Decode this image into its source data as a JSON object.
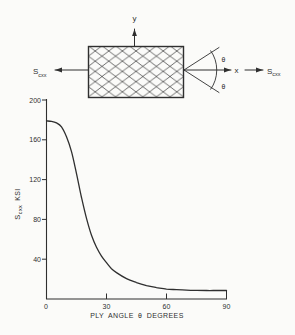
{
  "figure": {
    "ink": "#2f2f2f",
    "background": "#fbfbf9"
  },
  "diagram": {
    "y_arrow_label": "y",
    "x_arrow_label": "x",
    "theta_upper": "θ",
    "theta_lower": "θ",
    "stress_left_main": "S",
    "stress_left_sub": "cxx",
    "stress_right_main": "S",
    "stress_right_sub": "cxx"
  },
  "chart_data": {
    "type": "line",
    "title": "",
    "xlabel": "PLY ANGLE θ DEGREES",
    "ylabel_main": "S",
    "ylabel_sub": "cxx",
    "ylabel_unit": "KSI",
    "xlim": [
      0,
      90
    ],
    "ylim": [
      0,
      200
    ],
    "grid": false,
    "legend": "none",
    "xtick_values": [
      0,
      30,
      60,
      90
    ],
    "xtick_labels": [
      "0",
      "30",
      "60",
      "90"
    ],
    "ytick_values": [
      200,
      160,
      120,
      80,
      40
    ],
    "ytick_labels": [
      "200",
      "160",
      "120",
      "80",
      "40"
    ],
    "series": [
      {
        "name": "composite longitudinal strength vs ply angle",
        "points": [
          [
            0,
            179
          ],
          [
            2.5,
            178.5
          ],
          [
            5,
            177
          ],
          [
            7.5,
            173
          ],
          [
            10,
            163
          ],
          [
            12.5,
            148
          ],
          [
            15,
            126
          ],
          [
            17.5,
            102
          ],
          [
            20,
            81
          ],
          [
            22.5,
            64
          ],
          [
            25,
            52
          ],
          [
            27.5,
            43
          ],
          [
            30,
            36.5
          ],
          [
            32.5,
            30.5
          ],
          [
            35,
            26.5
          ],
          [
            40,
            20.5
          ],
          [
            45,
            16.5
          ],
          [
            50,
            13.5
          ],
          [
            55,
            11.5
          ],
          [
            60,
            10
          ],
          [
            65,
            9.3
          ],
          [
            70,
            8.8
          ],
          [
            75,
            8.6
          ],
          [
            80,
            8.5
          ],
          [
            85,
            8.5
          ],
          [
            90,
            8.5
          ]
        ]
      }
    ]
  }
}
